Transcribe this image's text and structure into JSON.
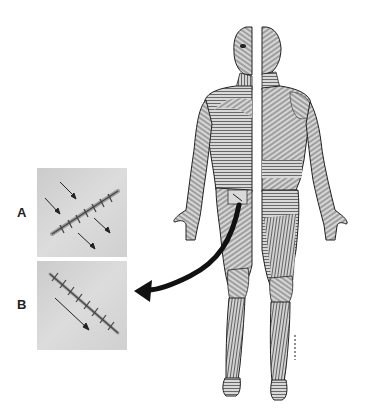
{
  "figure": {
    "views": [
      "anterior half (front)",
      "posterior half (back)"
    ],
    "highlighted_region": "rectangular skin patch on anterior thigh/groin with incision line",
    "arrow": "curved black arrow from highlighted patch pointing left to panel B"
  },
  "panels": [
    {
      "label": "A",
      "description": "Sutured incision running diagonally with four arrows showing tension perpendicular to wound"
    },
    {
      "label": "B",
      "description": "Sutured incision running diagonally with one arrow parallel to wound"
    }
  ],
  "colors": {
    "background": "#ffffff",
    "panel_bg": "#d6d6d6",
    "body_fill": "#bdbdbd",
    "line_ink": "#2a2a2a",
    "arrow": "#111111",
    "patch": "#d9d9d9"
  }
}
